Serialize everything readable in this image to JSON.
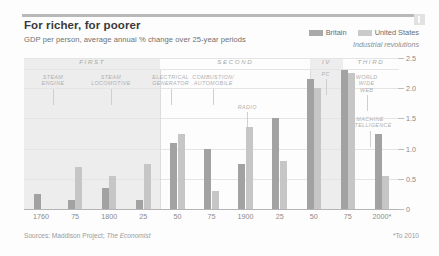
{
  "header": {
    "title": "For richer, for poorer",
    "subtitle": "GDP per person, average annual % change over 25-year periods"
  },
  "legend": {
    "britain": "Britain",
    "united_states": "United States",
    "industrial_revolutions": "Industrial revolutions"
  },
  "footer": {
    "sources_label": "Sources: Maddison Project;",
    "sources_pub": "The Economist",
    "note": "*To 2010"
  },
  "colors": {
    "britain": "#a2a2a2",
    "united_states": "#c6c6c6",
    "band": "#ededed",
    "axis": "#b4b4b4"
  },
  "chart_data": {
    "type": "bar",
    "title": "For richer, for poorer",
    "subtitle": "GDP per person, average annual % change over 25-year periods",
    "xlabel": "",
    "ylabel": "",
    "ylim": [
      0,
      2.5
    ],
    "yticks": [
      "0",
      "0.5",
      "1.0",
      "1.5",
      "2.0",
      "2.5"
    ],
    "grid": true,
    "legend_position": "top-right",
    "categories": [
      "1760",
      "75",
      "1800",
      "25",
      "50",
      "75",
      "1900",
      "25",
      "50",
      "75",
      "2000*"
    ],
    "series": [
      {
        "name": "Britain",
        "values": [
          0.25,
          0.15,
          0.35,
          0.15,
          1.1,
          1.0,
          0.75,
          1.5,
          2.15,
          2.3,
          1.25
        ]
      },
      {
        "name": "United States",
        "values": [
          0.0,
          0.7,
          0.55,
          0.75,
          1.25,
          0.3,
          1.35,
          0.8,
          2.0,
          2.25,
          0.55
        ]
      }
    ],
    "eras": [
      {
        "label": "FIRST",
        "start_index": 0,
        "end_index": 4
      },
      {
        "label": "SECOND",
        "start_index": 4,
        "end_index": 8.4
      },
      {
        "label": "IV",
        "start_index": 8.4,
        "end_index": 9.35
      },
      {
        "label": "THIRD",
        "start_index": 9.35,
        "end_index": 11
      }
    ],
    "innovations": [
      {
        "label": "STEAM\nENGINE",
        "x_index": 0.85
      },
      {
        "label": "STEAM\nLOCOMOTIVE",
        "x_index": 2.55
      },
      {
        "label": "ELECTRICAL\nGENERATOR",
        "x_index": 4.3
      },
      {
        "label": "COMBUSTION/\nAUTOMOBILE",
        "x_index": 5.55
      },
      {
        "label": "RADIO",
        "x_index": 6.55
      },
      {
        "label": "PC",
        "x_index": 8.85
      },
      {
        "label": "WORLD\nWIDE\nWEB",
        "x_index": 10.05
      },
      {
        "label": "MACHINE\nINTELLIGENCE",
        "x_index": 10.15
      }
    ]
  }
}
